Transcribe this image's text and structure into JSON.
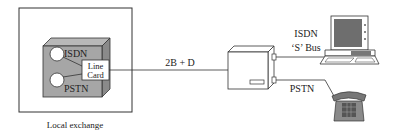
{
  "diagram": {
    "local_exchange": {
      "caption": "Local exchange",
      "isdn_label": "ISDN",
      "pstn_label": "PSTN",
      "line_card_line1": "Line",
      "line_card_line2": "Card"
    },
    "link_label": "2B + D",
    "customer_side": {
      "isdn_bus_line1": "ISDN",
      "isdn_bus_line2": "‘S’ Bus",
      "pstn_label": "PSTN"
    },
    "icons": [
      "computer-terminal-icon",
      "telephone-icon",
      "network-termination-box-icon"
    ],
    "colors": {
      "box_fill": "#a6a6a6",
      "box_side": "#8a8a8a",
      "stroke": "#333333",
      "screen": "#6e6e6e",
      "phone": "#777777"
    }
  }
}
